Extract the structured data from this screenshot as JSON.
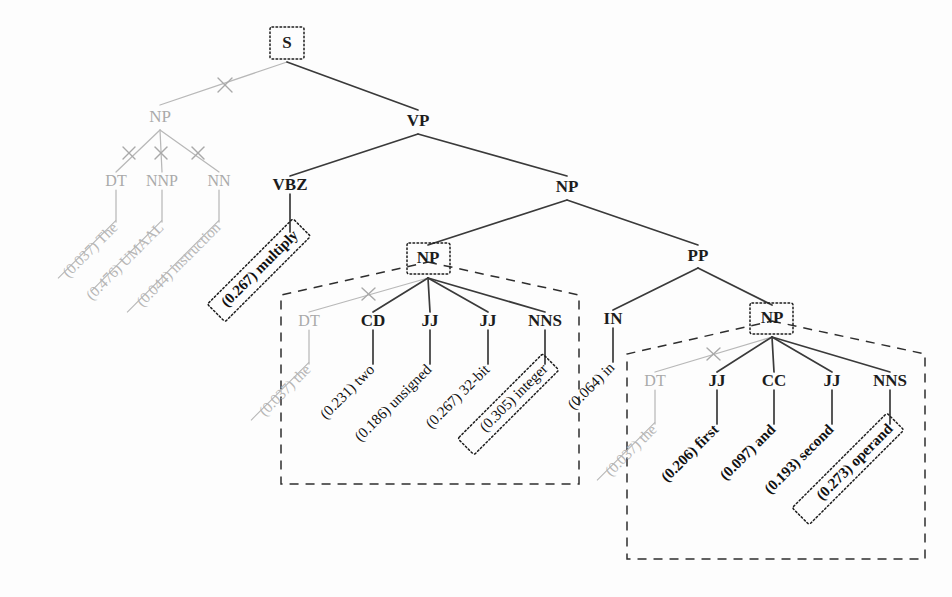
{
  "figure": {
    "kind": "constituency-parse-tree",
    "sentence": "The UMAAL instruction multiplies two unsigned 32-bit integers in the first and second operands",
    "background_color": "#fdfdfd",
    "active_color": "#1c1c1c",
    "pruned_color": "#b6b6b6"
  },
  "nodes": {
    "s": {
      "label": "S",
      "boxed": true,
      "state": "active"
    },
    "np_subj": {
      "label": "NP",
      "boxed": false,
      "state": "pruned"
    },
    "dt_subj": {
      "label": "DT",
      "boxed": false,
      "state": "pruned"
    },
    "nnp_subj": {
      "label": "NNP",
      "boxed": false,
      "state": "pruned"
    },
    "nn_subj": {
      "label": "NN",
      "boxed": false,
      "state": "pruned"
    },
    "vp": {
      "label": "VP",
      "boxed": false,
      "state": "active"
    },
    "vbz": {
      "label": "VBZ",
      "boxed": false,
      "state": "active"
    },
    "np_obj": {
      "label": "NP",
      "boxed": false,
      "state": "active"
    },
    "np_mid": {
      "label": "NP",
      "boxed": true,
      "state": "active"
    },
    "pp": {
      "label": "PP",
      "boxed": false,
      "state": "active"
    },
    "in": {
      "label": "IN",
      "boxed": false,
      "state": "active"
    },
    "np_right": {
      "label": "NP",
      "boxed": true,
      "state": "active"
    },
    "dt_mid": {
      "label": "DT",
      "boxed": false,
      "state": "pruned"
    },
    "cd_mid": {
      "label": "CD",
      "boxed": false,
      "state": "active"
    },
    "jj_mid_1": {
      "label": "JJ",
      "boxed": false,
      "state": "active"
    },
    "jj_mid_2": {
      "label": "JJ",
      "boxed": false,
      "state": "active"
    },
    "nns_mid": {
      "label": "NNS",
      "boxed": false,
      "state": "active"
    },
    "dt_right": {
      "label": "DT",
      "boxed": false,
      "state": "pruned"
    },
    "jj_right_1": {
      "label": "JJ",
      "boxed": false,
      "state": "active"
    },
    "cc_right": {
      "label": "CC",
      "boxed": false,
      "state": "active"
    },
    "jj_right_2": {
      "label": "JJ",
      "boxed": false,
      "state": "active"
    },
    "nns_right": {
      "label": "NNS",
      "boxed": false,
      "state": "active"
    }
  },
  "leaves": [
    {
      "id": "leaf-the-subj",
      "score": "(0.037)",
      "word": "The",
      "text": "(0.037) The",
      "state": "pruned",
      "boxed": false,
      "struck": true
    },
    {
      "id": "leaf-umaal",
      "score": "(0.476)",
      "word": "UMAAL",
      "text": "(0.476) UMAAL",
      "state": "pruned",
      "boxed": false,
      "struck": true
    },
    {
      "id": "leaf-instruction",
      "score": "(0.044)",
      "word": "instruction",
      "text": "(0.044) instruction",
      "state": "pruned",
      "boxed": false,
      "struck": true
    },
    {
      "id": "leaf-multiply",
      "score": "(0.267)",
      "word": "multiply",
      "text": "(0.267) multiply",
      "state": "active",
      "boxed": true,
      "struck": false
    },
    {
      "id": "leaf-the-mid",
      "score": "(0.037)",
      "word": "the",
      "text": "(0.037) the",
      "state": "pruned",
      "boxed": false,
      "struck": true
    },
    {
      "id": "leaf-two",
      "score": "(0.231)",
      "word": "two",
      "text": "(0.231) two",
      "state": "active",
      "boxed": false,
      "struck": false
    },
    {
      "id": "leaf-unsigned",
      "score": "(0.186)",
      "word": "unsigned",
      "text": "(0.186) unsigned",
      "state": "active",
      "boxed": false,
      "struck": false
    },
    {
      "id": "leaf-32bit",
      "score": "(0.267)",
      "word": "32-bit",
      "text": "(0.267) 32-bit",
      "state": "active",
      "boxed": false,
      "struck": false
    },
    {
      "id": "leaf-integer",
      "score": "(0.305)",
      "word": "integer",
      "text": "(0.305) integer",
      "state": "active",
      "boxed": true,
      "struck": false
    },
    {
      "id": "leaf-in",
      "score": "(0.064)",
      "word": "in",
      "text": "(0.064) in",
      "state": "active",
      "boxed": false,
      "struck": false
    },
    {
      "id": "leaf-the-right",
      "score": "(0.037)",
      "word": "the",
      "text": "(0.037) the",
      "state": "pruned",
      "boxed": false,
      "struck": true
    },
    {
      "id": "leaf-first",
      "score": "(0.206)",
      "word": "first",
      "text": "(0.206) first",
      "state": "active",
      "boxed": false,
      "struck": false
    },
    {
      "id": "leaf-and",
      "score": "(0.097)",
      "word": "and",
      "text": "(0.097) and",
      "state": "active",
      "boxed": false,
      "struck": false
    },
    {
      "id": "leaf-second",
      "score": "(0.193)",
      "word": "second",
      "text": "(0.193) second",
      "state": "active",
      "boxed": false,
      "struck": false
    },
    {
      "id": "leaf-operand",
      "score": "(0.273)",
      "word": "operand",
      "text": "(0.273) operand",
      "state": "active",
      "boxed": true,
      "struck": false
    }
  ]
}
